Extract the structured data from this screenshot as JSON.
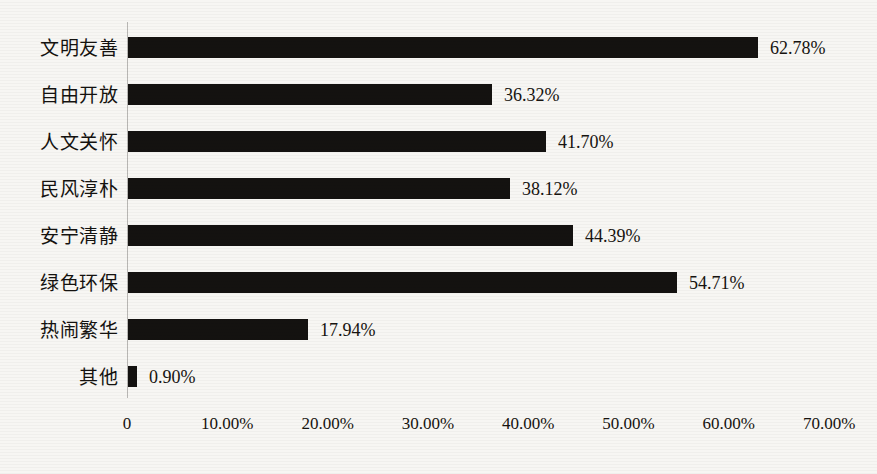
{
  "chart_data": {
    "type": "bar",
    "orientation": "horizontal",
    "title": "",
    "xlabel": "",
    "ylabel": "",
    "categories": [
      "文明友善",
      "自由开放",
      "人文关怀",
      "民风淳朴",
      "安宁清静",
      "绿色环保",
      "热闹繁华",
      "其他"
    ],
    "values": [
      62.78,
      36.32,
      41.7,
      38.12,
      44.39,
      54.71,
      17.94,
      0.9
    ],
    "value_labels": [
      "62.78%",
      "36.32%",
      "41.70%",
      "38.12%",
      "44.39%",
      "54.71%",
      "17.94%",
      "0.90%"
    ],
    "xlim": [
      0,
      70
    ],
    "xticks": [
      0,
      10,
      20,
      30,
      40,
      50,
      60,
      70
    ],
    "xtick_labels": [
      "0",
      "10.00%",
      "20.00%",
      "30.00%",
      "40.00%",
      "50.00%",
      "60.00%",
      "70.00%"
    ],
    "grid": false,
    "legend": null,
    "bar_color": "#141210",
    "background_color": "#f7f6f3",
    "axis_color": "#b9b7b4"
  }
}
